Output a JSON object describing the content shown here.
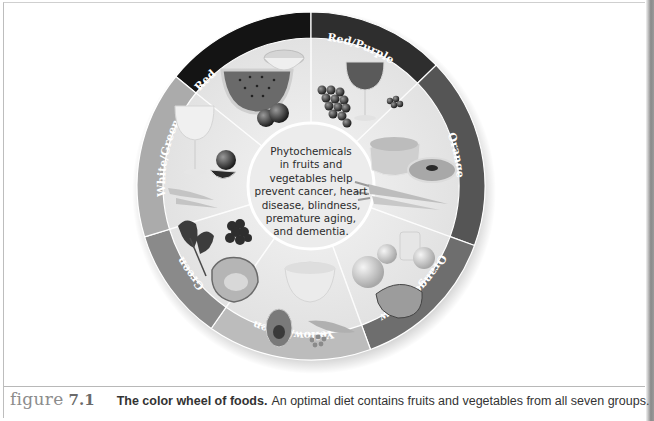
{
  "figure": {
    "label_word": "figure",
    "label_number": "7.1",
    "title": "The color wheel of foods.",
    "body": "An optimal diet contains fruits and vegetables from all seven groups."
  },
  "wheel": {
    "center_text": [
      "Phytochemicals",
      "in fruits and",
      "vegetables help",
      "prevent cancer, heart",
      "disease, blindness,",
      "premature aging,",
      "and dementia."
    ],
    "segments": [
      {
        "label": "Red",
        "ring_color": "#141414",
        "foods": [
          "watermelon slice",
          "half grapefruit",
          "cherries/plums"
        ]
      },
      {
        "label": "Red/Purple",
        "ring_color": "#2e2e2e",
        "foods": [
          "glass of red wine",
          "bunch of grapes",
          "berries"
        ]
      },
      {
        "label": "Orange",
        "ring_color": "#555555",
        "foods": [
          "cantaloupe",
          "carrots",
          "papaya slice"
        ]
      },
      {
        "label": "Orange/Yellow",
        "ring_color": "#6e6e6e",
        "foods": [
          "oranges",
          "glass of juice",
          "papaya",
          "peach"
        ]
      },
      {
        "label": "Yellow/Green",
        "ring_color": "#b8b8b8",
        "foods": [
          "honeydew melon",
          "avocado",
          "peas"
        ]
      },
      {
        "label": "Green",
        "ring_color": "#8a8a8a",
        "foods": [
          "kale",
          "broccoli",
          "cabbage"
        ]
      },
      {
        "label": "White/Green",
        "ring_color": "#a9a9a9",
        "foods": [
          "glass of white wine",
          "onion",
          "celery/leeks"
        ]
      }
    ]
  }
}
